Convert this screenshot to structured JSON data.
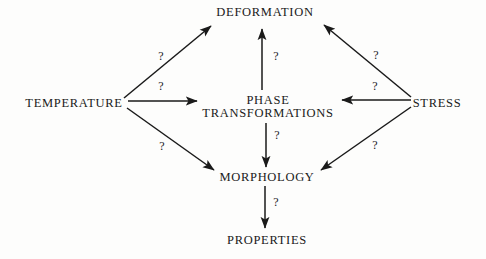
{
  "diagram": {
    "background_color": "#fdfdfc",
    "ink_color": "#1a1a1a",
    "nodes": [
      {
        "id": "temperature",
        "label": "TEMPERATURE",
        "x": 74,
        "y": 103
      },
      {
        "id": "deformation",
        "label": "DEFORMATION",
        "x": 265,
        "y": 12
      },
      {
        "id": "stress",
        "label": "STRESS",
        "x": 437,
        "y": 103
      },
      {
        "id": "phase_transformations_line1",
        "label": "PHASE",
        "x": 268,
        "y": 100
      },
      {
        "id": "phase_transformations_line2",
        "label": "TRANSFORMATIONS",
        "x": 268,
        "y": 113
      },
      {
        "id": "morphology",
        "label": "MORPHOLOGY",
        "x": 267,
        "y": 177
      },
      {
        "id": "properties",
        "label": "PROPERTIES",
        "x": 267,
        "y": 240
      }
    ],
    "edges": [
      {
        "id": "temperature-to-deformation",
        "from": "temperature",
        "to": "deformation",
        "x1": 124,
        "y1": 98,
        "x2": 211,
        "y2": 26,
        "label": "?"
      },
      {
        "id": "temperature-to-phase",
        "from": "temperature",
        "to": "phase_transformations",
        "x1": 128,
        "y1": 101,
        "x2": 197,
        "y2": 101,
        "label": "?"
      },
      {
        "id": "temperature-to-morphology",
        "from": "temperature",
        "to": "morphology",
        "x1": 127,
        "y1": 108,
        "x2": 214,
        "y2": 170,
        "label": "?"
      },
      {
        "id": "stress-to-deformation",
        "from": "stress",
        "to": "deformation",
        "x1": 411,
        "y1": 97,
        "x2": 324,
        "y2": 25,
        "label": "?"
      },
      {
        "id": "stress-to-phase",
        "from": "stress",
        "to": "phase_transformations",
        "x1": 411,
        "y1": 100,
        "x2": 342,
        "y2": 100,
        "label": "?"
      },
      {
        "id": "stress-to-morphology",
        "from": "stress",
        "to": "morphology",
        "x1": 411,
        "y1": 107,
        "x2": 321,
        "y2": 170,
        "label": "?"
      },
      {
        "id": "phase-to-deformation",
        "from": "phase_transformations",
        "to": "deformation",
        "x1": 262,
        "y1": 90,
        "x2": 262,
        "y2": 29,
        "label": "?"
      },
      {
        "id": "phase-to-morphology",
        "from": "phase_transformations",
        "to": "morphology",
        "x1": 266,
        "y1": 123,
        "x2": 266,
        "y2": 167,
        "label": "?"
      },
      {
        "id": "morphology-to-properties",
        "from": "morphology",
        "to": "properties",
        "x1": 265,
        "y1": 186,
        "x2": 265,
        "y2": 228,
        "label": "?"
      }
    ],
    "edge_labels": [
      {
        "id": "q-temperature-deformation",
        "text": "?",
        "x": 161,
        "y": 56
      },
      {
        "id": "q-temperature-phase",
        "text": "?",
        "x": 161,
        "y": 86
      },
      {
        "id": "q-temperature-morphology",
        "text": "?",
        "x": 162,
        "y": 146
      },
      {
        "id": "q-stress-deformation",
        "text": "?",
        "x": 376,
        "y": 55
      },
      {
        "id": "q-stress-phase",
        "text": "?",
        "x": 375,
        "y": 86
      },
      {
        "id": "q-stress-morphology",
        "text": "?",
        "x": 375,
        "y": 145
      },
      {
        "id": "q-phase-deformation",
        "text": "?",
        "x": 276,
        "y": 56
      },
      {
        "id": "q-phase-morphology",
        "text": "?",
        "x": 277,
        "y": 135
      },
      {
        "id": "q-morphology-properties",
        "text": "?",
        "x": 276,
        "y": 202
      }
    ]
  }
}
